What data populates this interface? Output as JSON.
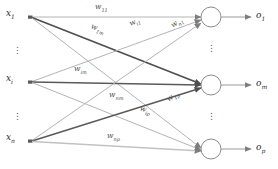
{
  "diagram": {
    "colors": {
      "line": "#9a9a9a",
      "line_bold": "#555555",
      "node_stroke": "#8c8c8c",
      "text": "#2b2b2b",
      "label_text": "#4a4a4a"
    },
    "inputs": [
      {
        "id": "x1",
        "base": "x",
        "sub": "1",
        "x": 12,
        "y": 14
      },
      {
        "id": "xi",
        "base": "x",
        "sub": "i",
        "x": 12,
        "y": 79
      },
      {
        "id": "xn",
        "base": "x",
        "sub": "n",
        "x": 12,
        "y": 138
      }
    ],
    "outputs": [
      {
        "id": "o1",
        "base": "o",
        "sub": "1",
        "x": 258,
        "y": 16
      },
      {
        "id": "om",
        "base": "o",
        "sub": "m",
        "x": 258,
        "y": 85
      },
      {
        "id": "op",
        "base": "o",
        "sub": "p",
        "x": 258,
        "y": 148
      }
    ],
    "weights": [
      {
        "id": "w11",
        "base": "w",
        "sub": "11",
        "x": 95,
        "y": 5,
        "rot": 0
      },
      {
        "id": "w1m",
        "base": "w",
        "sub": "1m",
        "x": 93,
        "y": 24,
        "rot": 22
      },
      {
        "id": "wi1",
        "base": "w",
        "sub": "i1",
        "x": 131,
        "y": 22,
        "rot": -22
      },
      {
        "id": "wn1",
        "base": "w",
        "sub": "n1",
        "x": 173,
        "y": 24,
        "rot": -32
      },
      {
        "id": "wim",
        "base": "w",
        "sub": "im",
        "x": 75,
        "y": 67,
        "rot": 0
      },
      {
        "id": "wnm",
        "base": "w",
        "sub": "nm",
        "x": 110,
        "y": 93,
        "rot": 0
      },
      {
        "id": "wip",
        "base": "w",
        "sub": "ip",
        "x": 141,
        "y": 106,
        "rot": 20
      },
      {
        "id": "w1p",
        "base": "w",
        "sub": "1p",
        "x": 169,
        "y": 99,
        "rot": 35
      },
      {
        "id": "wnp",
        "base": "w",
        "sub": "np",
        "x": 108,
        "y": 134,
        "rot": 0
      }
    ],
    "ellipses": [
      {
        "id": "input-ellipsis-top",
        "x": 17,
        "y": 46
      },
      {
        "id": "input-ellipsis-bottom",
        "x": 17,
        "y": 112
      },
      {
        "id": "output-ellipsis-top",
        "x": 212,
        "y": 42
      },
      {
        "id": "output-ellipsis-bottom",
        "x": 212,
        "y": 110
      }
    ],
    "caption": ""
  }
}
